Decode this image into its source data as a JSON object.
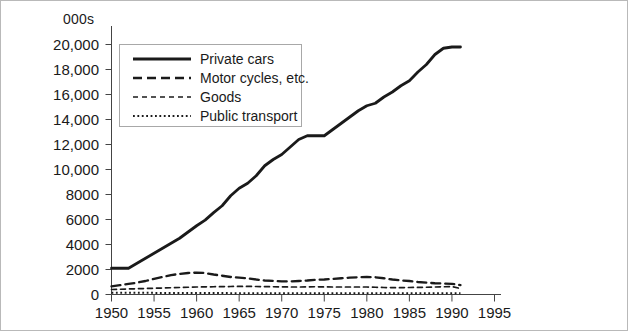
{
  "chart_data": {
    "type": "line",
    "title": "",
    "xlabel": "",
    "ylabel": "000s",
    "unit_label": "000s",
    "grid": false,
    "legend_position": "top-left inside plot",
    "xlim": [
      1950,
      1995
    ],
    "ylim": [
      0,
      20000
    ],
    "xticks": [
      1950,
      1955,
      1960,
      1965,
      1970,
      1975,
      1980,
      1985,
      1990,
      1995
    ],
    "xtick_labels": [
      "1950",
      "1955",
      "1960",
      "1965",
      "1970",
      "1975",
      "1980",
      "1985",
      "1990",
      "1995"
    ],
    "yticks": [
      0,
      2000,
      4000,
      6000,
      8000,
      10000,
      12000,
      14000,
      16000,
      18000,
      20000
    ],
    "ytick_labels": [
      "0",
      "2000",
      "4000",
      "6000",
      "8000",
      "10,000",
      "12,000",
      "14,000",
      "16,000",
      "18,000",
      "20,000"
    ],
    "x": [
      1950,
      1951,
      1952,
      1953,
      1954,
      1955,
      1956,
      1957,
      1958,
      1959,
      1960,
      1961,
      1962,
      1963,
      1964,
      1965,
      1966,
      1967,
      1968,
      1969,
      1970,
      1971,
      1972,
      1973,
      1974,
      1975,
      1976,
      1977,
      1978,
      1979,
      1980,
      1981,
      1982,
      1983,
      1984,
      1985,
      1986,
      1987,
      1988,
      1989,
      1990,
      1991
    ],
    "series": [
      {
        "name": "Private cars",
        "style": "solid",
        "color": "#1a1a1a",
        "values": [
          2100,
          2100,
          2100,
          2500,
          2900,
          3300,
          3700,
          4100,
          4500,
          5000,
          5500,
          5950,
          6550,
          7100,
          7900,
          8500,
          8900,
          9500,
          10300,
          10800,
          11200,
          11800,
          12400,
          12700,
          12700,
          12700,
          13200,
          13700,
          14200,
          14700,
          15100,
          15300,
          15800,
          16200,
          16700,
          17100,
          17800,
          18400,
          19200,
          19700,
          19800,
          19800
        ]
      },
      {
        "name": "Motor cycles, etc.",
        "style": "long-dash",
        "color": "#1a1a1a",
        "values": [
          650,
          750,
          850,
          950,
          1080,
          1250,
          1400,
          1550,
          1650,
          1720,
          1750,
          1720,
          1600,
          1500,
          1400,
          1350,
          1300,
          1200,
          1120,
          1080,
          1050,
          1050,
          1080,
          1120,
          1180,
          1200,
          1250,
          1300,
          1350,
          1380,
          1400,
          1380,
          1300,
          1200,
          1120,
          1080,
          1000,
          950,
          900,
          880,
          850,
          750
        ]
      },
      {
        "name": "Goods",
        "style": "short-dash",
        "color": "#1a1a1a",
        "values": [
          400,
          420,
          440,
          460,
          480,
          500,
          520,
          540,
          560,
          580,
          600,
          610,
          620,
          630,
          640,
          650,
          650,
          640,
          630,
          620,
          610,
          600,
          600,
          610,
          620,
          610,
          600,
          600,
          600,
          600,
          600,
          580,
          560,
          550,
          550,
          560,
          570,
          580,
          600,
          620,
          630,
          480
        ]
      },
      {
        "name": "Public transport",
        "style": "dotted",
        "color": "#1a1a1a",
        "values": [
          140,
          140,
          140,
          135,
          135,
          130,
          130,
          125,
          125,
          120,
          120,
          118,
          115,
          112,
          110,
          110,
          108,
          105,
          105,
          102,
          100,
          100,
          100,
          100,
          100,
          100,
          100,
          100,
          100,
          100,
          100,
          100,
          98,
          98,
          98,
          100,
          100,
          100,
          100,
          100,
          100,
          100
        ]
      }
    ]
  },
  "legend": {
    "items": [
      {
        "label": "Private cars",
        "style": "solid"
      },
      {
        "label": "Motor cycles, etc.",
        "style": "long-dash"
      },
      {
        "label": "Goods",
        "style": "short-dash"
      },
      {
        "label": "Public transport",
        "style": "dotted"
      }
    ]
  }
}
